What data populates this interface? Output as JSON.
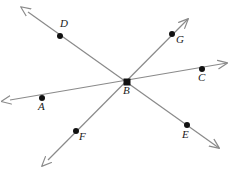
{
  "diagram": {
    "type": "intersecting-lines",
    "canvas": {
      "width": 236,
      "height": 170,
      "background": "#ffffff"
    },
    "style": {
      "line_color": "#8a8a8a",
      "line_width": 1.2,
      "dot_color": "#111111",
      "dot_radius": 3,
      "label_color": "#1a1a1a",
      "label_font_size": 11
    },
    "intersection": {
      "label": "B",
      "x": 127,
      "y": 82
    },
    "lines": [
      {
        "name": "line-ac",
        "through": [
          "A",
          "B",
          "C"
        ],
        "start_arrow": {
          "x": 10,
          "y": 100
        },
        "end_arrow": {
          "x": 227,
          "y": 63
        },
        "arrowheads": "both"
      },
      {
        "name": "line-de",
        "through": [
          "D",
          "B",
          "E"
        ],
        "start_arrow": {
          "x": 28,
          "y": 12
        },
        "end_arrow": {
          "x": 219,
          "y": 148
        },
        "arrowheads": "both"
      },
      {
        "name": "line-fg",
        "through": [
          "F",
          "B",
          "G"
        ],
        "start_arrow": {
          "x": 48,
          "y": 160
        },
        "end_arrow": {
          "x": 188,
          "y": 19
        },
        "arrowheads": "both"
      }
    ],
    "points": [
      {
        "label": "A",
        "x": 42,
        "y": 98,
        "label_x": 38,
        "label_y": 101,
        "on_line": "line-ac"
      },
      {
        "label": "B",
        "x": 127,
        "y": 82,
        "label_x": 123,
        "label_y": 85,
        "on_line": "all"
      },
      {
        "label": "C",
        "x": 202,
        "y": 69,
        "label_x": 198,
        "label_y": 72,
        "on_line": "line-ac"
      },
      {
        "label": "D",
        "x": 60,
        "y": 36,
        "label_x": 60,
        "label_y": 18,
        "on_line": "line-de"
      },
      {
        "label": "E",
        "x": 187,
        "y": 125,
        "label_x": 182,
        "label_y": 129,
        "on_line": "line-de"
      },
      {
        "label": "F",
        "x": 76,
        "y": 131,
        "label_x": 79,
        "label_y": 131,
        "on_line": "line-fg"
      },
      {
        "label": "G",
        "x": 172,
        "y": 34,
        "label_x": 176,
        "label_y": 34,
        "on_line": "line-fg"
      }
    ]
  }
}
